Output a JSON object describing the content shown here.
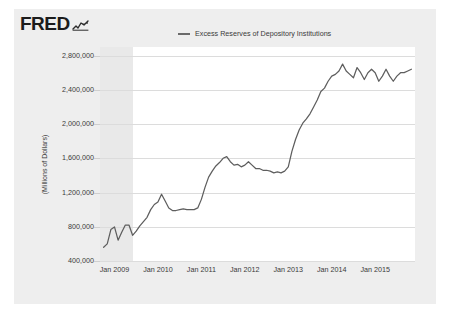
{
  "brand": {
    "wordmark": "FRED",
    "spark_icon": "line-chart-spark-icon"
  },
  "legend": {
    "items": [
      {
        "label": "Excess Reserves of Depository Institutions",
        "color": "#6a6a6a"
      }
    ]
  },
  "axes": {
    "y_title": "(Millions of Dollars)"
  },
  "colors": {
    "page_background": "#ffffff",
    "card_background": "#eeeeee",
    "plot_background": "#ffffff",
    "gridline": "#dcdcdc",
    "recession_shading": "#e9e9e9",
    "series_line": "#5e5e5e",
    "text": "#3a3a3a"
  },
  "chart_data": {
    "type": "line",
    "title": "",
    "subtitle": "",
    "xlabel": "",
    "ylabel": "(Millions of Dollars)",
    "ylim": [
      400000,
      2900000
    ],
    "yticks": [
      400000,
      800000,
      1200000,
      1600000,
      2000000,
      2400000,
      2800000
    ],
    "ytick_labels": [
      "400,000",
      "800,000",
      "1,200,000",
      "1,600,000",
      "2,000,000",
      "2,400,000",
      "2,800,000"
    ],
    "xlim": [
      "2008-09",
      "2015-12"
    ],
    "xticks": [
      "2009-01",
      "2010-01",
      "2011-01",
      "2012-01",
      "2013-01",
      "2014-01",
      "2015-01"
    ],
    "xtick_labels": [
      "Jan 2009",
      "Jan 2010",
      "Jan 2011",
      "Jan 2012",
      "Jan 2013",
      "Jan 2014",
      "Jan 2015"
    ],
    "grid": true,
    "legend_position": "top-center",
    "shaded_regions": [
      {
        "name": "recession",
        "from": "2008-09",
        "to": "2009-06",
        "color": "#e9e9e9"
      }
    ],
    "series": [
      {
        "name": "Excess Reserves of Depository Institutions",
        "color": "#5e5e5e",
        "x": [
          "2008-10",
          "2008-11",
          "2008-12",
          "2009-01",
          "2009-02",
          "2009-03",
          "2009-04",
          "2009-05",
          "2009-06",
          "2009-07",
          "2009-08",
          "2009-09",
          "2009-10",
          "2009-11",
          "2009-12",
          "2010-01",
          "2010-02",
          "2010-03",
          "2010-04",
          "2010-05",
          "2010-06",
          "2010-07",
          "2010-08",
          "2010-09",
          "2010-10",
          "2010-11",
          "2010-12",
          "2011-01",
          "2011-02",
          "2011-03",
          "2011-04",
          "2011-05",
          "2011-06",
          "2011-07",
          "2011-08",
          "2011-09",
          "2011-10",
          "2011-11",
          "2011-12",
          "2012-01",
          "2012-02",
          "2012-03",
          "2012-04",
          "2012-05",
          "2012-06",
          "2012-07",
          "2012-08",
          "2012-09",
          "2012-10",
          "2012-11",
          "2012-12",
          "2013-01",
          "2013-02",
          "2013-03",
          "2013-04",
          "2013-05",
          "2013-06",
          "2013-07",
          "2013-08",
          "2013-09",
          "2013-10",
          "2013-11",
          "2013-12",
          "2014-01",
          "2014-02",
          "2014-03",
          "2014-04",
          "2014-05",
          "2014-06",
          "2014-07",
          "2014-08",
          "2014-09",
          "2014-10",
          "2014-11",
          "2014-12",
          "2015-01",
          "2015-02",
          "2015-03",
          "2015-04",
          "2015-05",
          "2015-06",
          "2015-07",
          "2015-08",
          "2015-09",
          "2015-10",
          "2015-11"
        ],
        "values": [
          560000,
          600000,
          767000,
          798000,
          643000,
          735000,
          820000,
          820000,
          700000,
          748000,
          810000,
          860000,
          910000,
          1000000,
          1060000,
          1090000,
          1180000,
          1100000,
          1020000,
          990000,
          990000,
          1000000,
          1010000,
          1000000,
          1000000,
          1000000,
          1020000,
          1120000,
          1260000,
          1380000,
          1450000,
          1510000,
          1550000,
          1600000,
          1620000,
          1560000,
          1520000,
          1530000,
          1500000,
          1520000,
          1560000,
          1520000,
          1480000,
          1480000,
          1460000,
          1460000,
          1450000,
          1430000,
          1440000,
          1430000,
          1450000,
          1500000,
          1680000,
          1820000,
          1930000,
          2010000,
          2060000,
          2120000,
          2200000,
          2280000,
          2380000,
          2420000,
          2500000,
          2560000,
          2580000,
          2620000,
          2700000,
          2620000,
          2580000,
          2540000,
          2660000,
          2600000,
          2520000,
          2600000,
          2640000,
          2600000,
          2500000,
          2560000,
          2640000,
          2560000,
          2500000,
          2560000,
          2600000,
          2600000,
          2620000,
          2640000
        ]
      }
    ]
  }
}
